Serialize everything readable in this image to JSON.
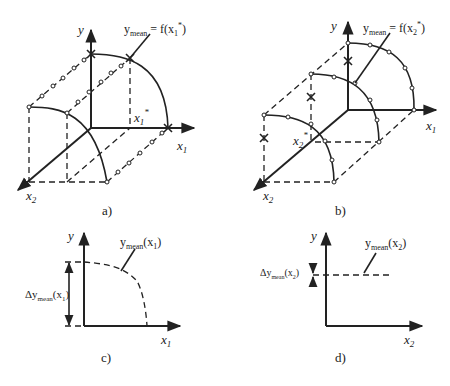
{
  "figure": {
    "panels": [
      {
        "id": "a",
        "caption": "a)",
        "axis_y": "y",
        "axis_x1": "x",
        "axis_x1_sub": "1",
        "axis_x2": "x",
        "axis_x2_sub": "2",
        "marker_x1star": "x",
        "marker_x1star_sub": "1",
        "marker_star": "*",
        "annotation_y": "y",
        "annotation_sub": "mean",
        "annotation_eq": " = f(x",
        "annotation_eq_sub": "1",
        "annotation_eq_tail": "*)"
      },
      {
        "id": "b",
        "caption": "b)",
        "axis_y": "y",
        "axis_x1": "x",
        "axis_x1_sub": "1",
        "axis_x2": "x",
        "axis_x2_sub": "2",
        "marker_x2star": "x",
        "marker_x2star_sub": "2",
        "marker_star": "*",
        "annotation_y": "y",
        "annotation_sub": "mean",
        "annotation_eq": " = f(x",
        "annotation_eq_sub": "2",
        "annotation_eq_tail": "*)"
      },
      {
        "id": "c",
        "caption": "c)",
        "axis_y": "y",
        "axis_x": "x",
        "axis_x_sub": "1",
        "curve_label_y": "y",
        "curve_label_sub": "mean",
        "curve_label_arg": "(x",
        "curve_label_arg_sub": "1",
        "curve_label_close": ")",
        "delta_label_prefix": "Δy",
        "delta_label_sub": "mean",
        "delta_label_arg": "(x",
        "delta_label_arg_sub": "1",
        "delta_label_close": ")"
      },
      {
        "id": "d",
        "caption": "d)",
        "axis_y": "y",
        "axis_x": "x",
        "axis_x_sub": "2",
        "curve_label_y": "y",
        "curve_label_sub": "mean",
        "curve_label_arg": "(x",
        "curve_label_arg_sub": "2",
        "curve_label_close": ")",
        "delta_label_prefix": "Δy",
        "delta_label_sub": "mean",
        "delta_label_arg": "(x",
        "delta_label_arg_sub": "2",
        "delta_label_close": ")"
      }
    ],
    "colors": {
      "ink": "#222222",
      "background": "#ffffff"
    }
  }
}
